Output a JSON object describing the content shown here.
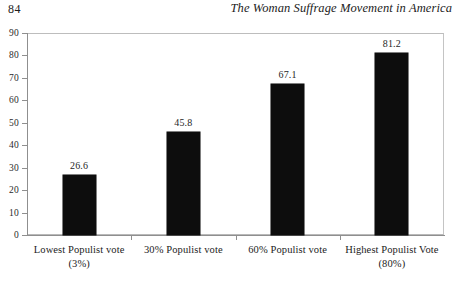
{
  "page": {
    "folio": "84",
    "running_head": "The Woman Suffrage Movement in America"
  },
  "chart_data": {
    "type": "bar",
    "title": "",
    "subtitle": "",
    "xlabel": "",
    "ylabel": "",
    "categories": [
      "Lowest Populist vote",
      "30% Populist vote",
      "60% Populist vote",
      "Highest Populist Vote"
    ],
    "category_sublabels": [
      "(3%)",
      "",
      "",
      "(80%)"
    ],
    "values": [
      26.6,
      45.8,
      67.1,
      81.2
    ],
    "value_labels": [
      "26.6",
      "45.8",
      "67.1",
      "81.2"
    ],
    "ylim": [
      0,
      90
    ],
    "ytick_step": 10,
    "ytick_labels": [
      "0",
      "10",
      "20",
      "30",
      "40",
      "50",
      "60",
      "70",
      "80",
      "90"
    ],
    "grid": false,
    "legend": false,
    "bar_color": "#0d0d0d",
    "frame_color": "#b9b9b9",
    "axis_color": "#8f8f8f"
  }
}
